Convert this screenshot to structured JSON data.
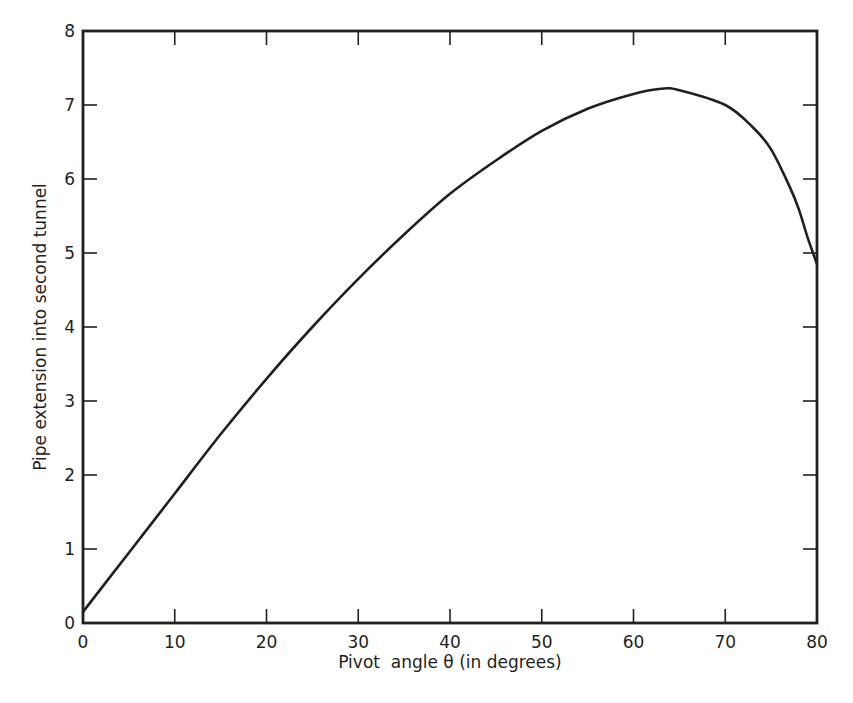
{
  "chart_data": {
    "type": "line",
    "title": "",
    "xlabel": "Pivot  angle θ (in degrees)",
    "ylabel": "Pipe extension into second tunnel",
    "xlim": [
      0,
      80
    ],
    "ylim": [
      0,
      8
    ],
    "xticks": [
      0,
      10,
      20,
      30,
      40,
      50,
      60,
      70,
      80
    ],
    "yticks": [
      0,
      1,
      2,
      3,
      4,
      5,
      6,
      7,
      8
    ],
    "grid": false,
    "legend": null,
    "series": [
      {
        "name": "Pipe extension",
        "color": "#231f20",
        "x": [
          0,
          5,
          10,
          15,
          20,
          25,
          30,
          35,
          40,
          45,
          50,
          55,
          60,
          63,
          65,
          70,
          73,
          75,
          77,
          78,
          79,
          80
        ],
        "values": [
          0.15,
          0.95,
          1.75,
          2.55,
          3.3,
          4.0,
          4.65,
          5.25,
          5.8,
          6.25,
          6.65,
          6.95,
          7.15,
          7.22,
          7.2,
          7.0,
          6.7,
          6.4,
          5.9,
          5.6,
          5.2,
          4.85
        ]
      }
    ]
  },
  "layout": {
    "plot_left": 83,
    "plot_top": 31,
    "plot_right": 817,
    "plot_bottom": 623
  }
}
